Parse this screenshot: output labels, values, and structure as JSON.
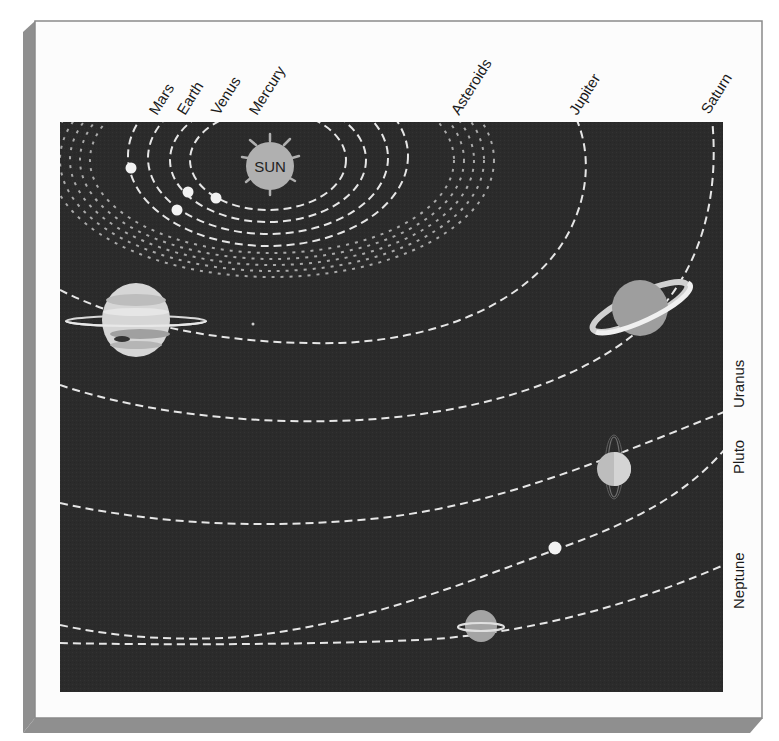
{
  "diagram": {
    "colors": {
      "frame_shadow": "#8f8f8f",
      "card": "#fcfcfc",
      "space": "#2b2b2b",
      "orbit": "#e6e6e6",
      "asteroid": "#a9a9a9",
      "sun": "#b0b0b0",
      "planet_light": "#efefef"
    },
    "sun": {
      "label": "SUN"
    },
    "labels": {
      "mars": "Mars",
      "earth": "Earth",
      "venus": "Venus",
      "mercury": "Mercury",
      "asteroids": "Asteroids",
      "jupiter": "Jupiter",
      "saturn": "Saturn",
      "uranus": "Uranus",
      "pluto": "Pluto",
      "neptune": "Neptune"
    },
    "bodies": [
      "Mercury",
      "Venus",
      "Earth",
      "Mars",
      "Asteroids",
      "Jupiter",
      "Saturn",
      "Uranus",
      "Neptune",
      "Pluto"
    ]
  }
}
